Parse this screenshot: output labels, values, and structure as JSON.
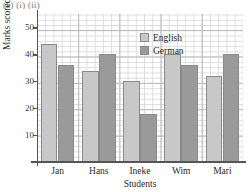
{
  "question_label": "(a) (i) (ii)",
  "legend": {
    "position": "top-center",
    "entries": [
      {
        "label": "English",
        "color": "#c8c8c8",
        "swatch": "english-swatch"
      },
      {
        "label": "German",
        "color": "#9a9a9a",
        "swatch": "german-swatch"
      }
    ]
  },
  "chart_data": {
    "type": "bar",
    "title": "",
    "subtitle": "",
    "xlabel": "Students",
    "ylabel": "Marks scored",
    "categories": [
      "Jan",
      "Hans",
      "Ineke",
      "Wim",
      "Mari"
    ],
    "series": [
      {
        "name": "English",
        "color": "#c8c8c8",
        "values": [
          44,
          34,
          30,
          40,
          32
        ]
      },
      {
        "name": "German",
        "color": "#9a9a9a",
        "values": [
          36,
          40,
          18,
          36,
          40
        ]
      }
    ],
    "ylim": [
      0,
      55
    ],
    "xlim": [
      0,
      5
    ],
    "yticks": [
      10,
      20,
      30,
      40,
      50
    ],
    "ytick_labels": [
      "10",
      "20",
      "30",
      "40",
      "50"
    ],
    "grid": true,
    "grid_style": "graph-paper minor and major squares",
    "legend_position": "top-center",
    "bar_group_count": 5,
    "bars_per_group": 2
  }
}
